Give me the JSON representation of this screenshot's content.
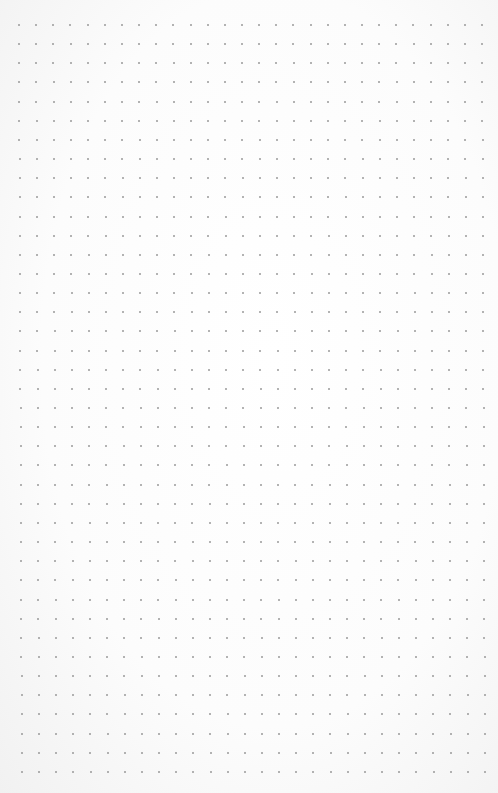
{
  "canvas": {
    "type": "dot-grid-paper",
    "background": "#fcfcfc",
    "dot_color": "#9a9a9a",
    "columns": 28,
    "rows": 40,
    "origin_x": 19,
    "origin_y": 25,
    "spacing_x": 17.15,
    "spacing_y": 19.15,
    "dot_size": 2
  }
}
